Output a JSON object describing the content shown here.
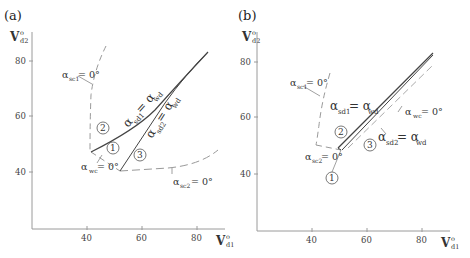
{
  "figure": {
    "panels": [
      {
        "id": "a",
        "label": "(a)",
        "y_axis": {
          "symbol": "V",
          "sup": "o",
          "sub": "d2",
          "ticks": [
            "80",
            "60",
            "40"
          ]
        },
        "x_axis": {
          "symbol": "V",
          "sup": "o",
          "sub": "d1",
          "ticks": [
            "40",
            "60",
            "80"
          ]
        },
        "regions": [
          "1",
          "2",
          "3"
        ],
        "annotations": {
          "asc1": {
            "alpha": "α",
            "sub": "sc1",
            "rest": "= 0°"
          },
          "wc": {
            "alpha": "α",
            "sub": "wc",
            "rest": "= 0°"
          },
          "sc2": {
            "alpha": "α",
            "sub": "sc2",
            "rest": "= 0°"
          },
          "sd1_wd": {
            "alpha": "α",
            "sub": "sd1",
            "eq": "= α",
            "sub2": "wd"
          },
          "sd2_wd": {
            "alpha": "α",
            "sub": "sd2",
            "eq": "= α",
            "sub2": "wd"
          }
        }
      },
      {
        "id": "b",
        "label": "(b)",
        "y_axis": {
          "symbol": "V",
          "sup": "o",
          "sub": "d2",
          "ticks": [
            "80",
            "60",
            "40"
          ]
        },
        "x_axis": {
          "symbol": "V",
          "sup": "o",
          "sub": "d1",
          "ticks": [
            "40",
            "60",
            "80"
          ]
        },
        "regions": [
          "1",
          "2",
          "3"
        ],
        "annotations": {
          "asc1": {
            "alpha": "α",
            "sub": "sc1",
            "rest": "= 0°"
          },
          "wc": {
            "alpha": "α",
            "sub": "wc",
            "rest": "= 0°"
          },
          "sc2": {
            "alpha": "α",
            "sub": "sc2",
            "rest": "= 0°"
          },
          "sd1_wd": {
            "alpha": "α",
            "sub": "sd1",
            "eq": "= α",
            "sub2": "wd"
          },
          "sd2_wd": {
            "alpha": "α",
            "sub": "sd2",
            "eq": "= α",
            "sub2": "wd"
          }
        }
      }
    ],
    "colors": {
      "axis": "#9a9a9a",
      "solid_line": "#444444",
      "dashed_line": "#999999",
      "text": "#333333"
    }
  }
}
